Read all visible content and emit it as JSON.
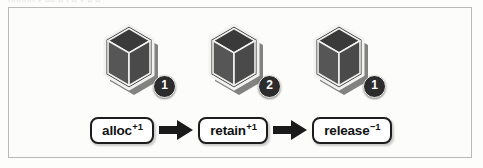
{
  "figure": {
    "caption_sliver": "nnnnn  y  pp  g   j  g  y  p  g",
    "frame_border_color": "#b9b9b9",
    "page_background": "#fdfdfc"
  },
  "colors": {
    "cube_outline": "#f2f2f0",
    "cube_top_face": "#3a3a3a",
    "cube_left_face": "#565656",
    "cube_right_face": "#4a4a4a",
    "cube_shadow": "#1e1e1e",
    "badge_fill": "#2c2c2c",
    "badge_text": "#ffffff",
    "button_border": "#1d1d1d",
    "button_fill": "#ffffff",
    "button_text": "#121212",
    "arrow_fill": "#1a1a1a"
  },
  "objects": [
    {
      "id": "object-1",
      "icon": "cube-icon",
      "badge_name": "retain-count-badge",
      "retain_count": "1"
    },
    {
      "id": "object-2",
      "icon": "cube-icon",
      "badge_name": "retain-count-badge",
      "retain_count": "2"
    },
    {
      "id": "object-3",
      "icon": "cube-icon",
      "badge_name": "retain-count-badge",
      "retain_count": "1"
    }
  ],
  "flow": {
    "steps": [
      {
        "label": "alloc",
        "delta": "+1"
      },
      {
        "label": "retain",
        "delta": "+1"
      },
      {
        "label": "release",
        "delta": "−1"
      }
    ],
    "arrows": [
      {
        "name": "flow-arrow-right"
      },
      {
        "name": "flow-arrow-right"
      }
    ]
  }
}
